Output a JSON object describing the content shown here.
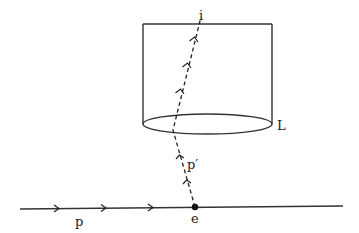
{
  "diagram": {
    "type": "physics-scattering-diagram",
    "labels": {
      "incoming_particle": "p",
      "scattered_particle": "p′",
      "vertex": "e",
      "detector_end": "i",
      "lens": "L"
    },
    "incoming_arrow_count": 3,
    "upper_dashed_arrow_count": 3,
    "lower_dashed_arrow_count": 2
  }
}
